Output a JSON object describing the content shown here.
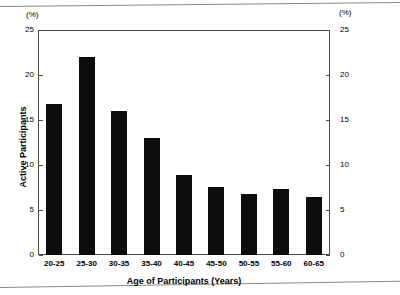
{
  "chart_data": {
    "type": "bar",
    "title": "",
    "xlabel": "Age of Participants (Years)",
    "ylabel": "Active Participants",
    "unit_label_left": "(%)",
    "unit_label_right": "(%)",
    "categories": [
      "20-25",
      "25-30",
      "30-35",
      "35-40",
      "40-45",
      "45-50",
      "50-55",
      "55-60",
      "60-65"
    ],
    "values": [
      16.8,
      22.0,
      16.0,
      13.0,
      8.9,
      7.6,
      6.8,
      7.3,
      6.4
    ],
    "series": [
      {
        "name": "Active Participants",
        "values": [
          16.8,
          22.0,
          16.0,
          13.0,
          8.9,
          7.6,
          6.8,
          7.3,
          6.4
        ]
      }
    ],
    "ylim": [
      0,
      25
    ],
    "yticks": [
      0,
      5,
      10,
      15,
      20,
      25
    ],
    "ytick_labels_left": [
      "25",
      "20",
      "15",
      "10",
      "5",
      "0"
    ],
    "ytick_labels_right": [
      "25",
      "20",
      "15",
      "10",
      "5",
      "0"
    ],
    "grid": false,
    "legend": false,
    "bar_color": "#0d0d0d",
    "axis_color": "#4d4d4d",
    "background_color": "#ffffff",
    "dual_axis": true
  }
}
